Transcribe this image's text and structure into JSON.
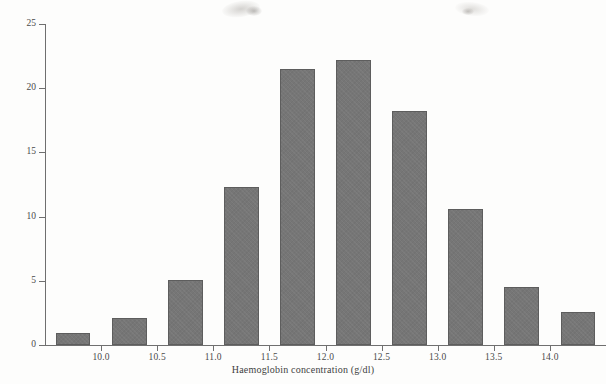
{
  "figure": {
    "background_color": "#fdfdfc",
    "axis_color": "#6f6f6f",
    "bar_fill_color": "#767676",
    "bar_edge_color": "#5d5d5d"
  },
  "chart_data": {
    "type": "bar",
    "title": "",
    "subtitle": "",
    "xlabel": "Haemoglobin concentration (g/dl)",
    "ylabel": "Percentage",
    "xlim": [
      9.5,
      14.5
    ],
    "ylim": [
      0,
      25
    ],
    "grid": false,
    "legend": null,
    "bin_width": 0.5,
    "bar_width_fraction": 0.62,
    "xticks": [
      10.0,
      10.5,
      11.0,
      11.5,
      12.0,
      12.5,
      13.0,
      13.5,
      14.0
    ],
    "xtick_labels": [
      "10.0",
      "10.5",
      "11.0",
      "11.5",
      "12.0",
      "12.5",
      "13.0",
      "13.5",
      "14.0"
    ],
    "yticks": [
      0,
      5,
      10,
      15,
      20,
      25
    ],
    "ytick_labels": [
      "0",
      "5",
      "10",
      "15",
      "20",
      "25"
    ],
    "bin_centers": [
      9.75,
      10.25,
      10.75,
      11.25,
      11.75,
      12.25,
      12.75,
      13.25,
      13.75,
      14.25
    ],
    "bin_ranges": [
      "9.50-10.00",
      "10.00-10.50",
      "10.50-11.00",
      "11.00-11.50",
      "11.50-12.00",
      "12.00-12.50",
      "12.50-13.00",
      "13.00-13.50",
      "13.50-14.00",
      "14.00-14.50"
    ],
    "categories": [
      "9.75",
      "10.25",
      "10.75",
      "11.25",
      "11.75",
      "12.25",
      "12.75",
      "13.25",
      "13.75",
      "14.25"
    ],
    "values": [
      0.9,
      2.1,
      5.1,
      12.3,
      21.5,
      22.2,
      18.2,
      10.6,
      4.5,
      2.6
    ]
  }
}
